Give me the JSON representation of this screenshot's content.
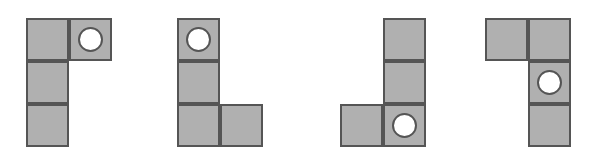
{
  "figure": {
    "background_color": "#ffffff",
    "cell_fill_color": "#b0b0b0",
    "cell_stroke_color": "#555555",
    "marker_fill_color": "#ffffff",
    "marker_stroke_color": "#555555",
    "cell_size": 43,
    "stroke_width": 2,
    "marker_diameter": 25,
    "shape_count": 4,
    "cells_per_shape": 4,
    "shapes": [
      {
        "id": "shape-1",
        "label": "Shape 1",
        "origin_x": 26,
        "origin_y": 18,
        "cells": [
          {
            "name": "cell-top-left",
            "col": 0,
            "row": 0
          },
          {
            "name": "cell-top-right",
            "col": 1,
            "row": 0
          },
          {
            "name": "cell-middle-left",
            "col": 0,
            "row": 1
          },
          {
            "name": "cell-bottom-left",
            "col": 0,
            "row": 2
          }
        ],
        "marker": {
          "name": "marker-circle",
          "col": 1,
          "row": 0
        }
      },
      {
        "id": "shape-2",
        "label": "Shape 2",
        "origin_x": 177,
        "origin_y": 18,
        "cells": [
          {
            "name": "cell-top-left",
            "col": 0,
            "row": 0
          },
          {
            "name": "cell-middle-left",
            "col": 0,
            "row": 1
          },
          {
            "name": "cell-bottom-left",
            "col": 0,
            "row": 2
          },
          {
            "name": "cell-bottom-right",
            "col": 1,
            "row": 2
          }
        ],
        "marker": {
          "name": "marker-circle",
          "col": 0,
          "row": 0
        }
      },
      {
        "id": "shape-3",
        "label": "Shape 3",
        "origin_x": 340,
        "origin_y": 18,
        "cells": [
          {
            "name": "cell-top-right",
            "col": 1,
            "row": 0
          },
          {
            "name": "cell-middle-right",
            "col": 1,
            "row": 1
          },
          {
            "name": "cell-bottom-left",
            "col": 0,
            "row": 2
          },
          {
            "name": "cell-bottom-right",
            "col": 1,
            "row": 2
          }
        ],
        "marker": {
          "name": "marker-circle",
          "col": 1,
          "row": 2
        }
      },
      {
        "id": "shape-4",
        "label": "Shape 4",
        "origin_x": 485,
        "origin_y": 18,
        "cells": [
          {
            "name": "cell-top-left",
            "col": 0,
            "row": 0
          },
          {
            "name": "cell-top-right",
            "col": 1,
            "row": 0
          },
          {
            "name": "cell-middle-right",
            "col": 1,
            "row": 1
          },
          {
            "name": "cell-bottom-right",
            "col": 1,
            "row": 2
          }
        ],
        "marker": {
          "name": "marker-circle",
          "col": 1,
          "row": 1
        }
      }
    ]
  }
}
